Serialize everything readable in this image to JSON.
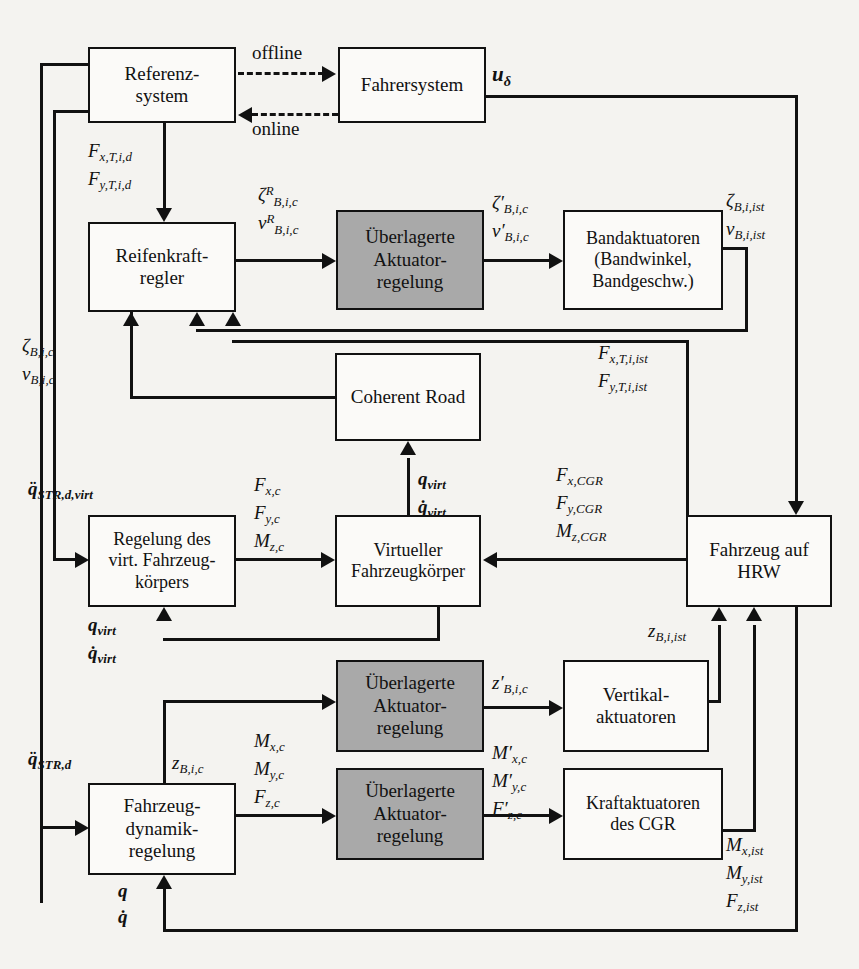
{
  "diagram": {
    "shaded_color": "#a9a9a9",
    "line_color": "#111111",
    "background": "#f4f3f0"
  },
  "blocks": {
    "referenzsystem": {
      "line1": "Referenz-",
      "line2": "system",
      "line3": ""
    },
    "fahrersystem": {
      "line1": "Fahrersystem",
      "line2": "",
      "line3": ""
    },
    "reifenkraftregler": {
      "line1": "Reifenkraft-",
      "line2": "regler",
      "line3": ""
    },
    "ueberlagerte_1": {
      "line1": "Überlagerte",
      "line2": "Aktuator-",
      "line3": "regelung"
    },
    "bandaktuatoren": {
      "line1": "Bandaktuatoren",
      "line2": "(Bandwinkel,",
      "line3": "Bandgeschw.)"
    },
    "coherent_road": {
      "line1": "Coherent Road",
      "line2": "",
      "line3": ""
    },
    "regelung_virt": {
      "line1": "Regelung des",
      "line2": "virt. Fahrzeug-",
      "line3": "körpers"
    },
    "virtueller_koerper": {
      "line1": "Virtueller",
      "line2": "Fahrzeugkörper",
      "line3": ""
    },
    "fahrzeug_hrw": {
      "line1": "Fahrzeug auf",
      "line2": "HRW",
      "line3": ""
    },
    "ueberlagerte_2": {
      "line1": "Überlagerte",
      "line2": "Aktuator-",
      "line3": "regelung"
    },
    "vertikalaktuatoren": {
      "line1": "Vertikal-",
      "line2": "aktuatoren",
      "line3": ""
    },
    "ueberlagerte_3": {
      "line1": "Überlagerte",
      "line2": "Aktuator-",
      "line3": "regelung"
    },
    "kraftaktuatoren": {
      "line1": "Kraftaktuatoren",
      "line2": "des CGR",
      "line3": ""
    },
    "fahrzeugdynamik": {
      "line1": "Fahrzeug-",
      "line2": "dynamik-",
      "line3": "regelung"
    }
  },
  "signals": {
    "offline": "offline",
    "online": "online",
    "u_delta": "uδ",
    "F_xTid": "Fx,T,i,d",
    "F_yTid": "Fy,T,i,d",
    "zeta_R_Bic": "ζRB,i,c",
    "v_R_Bic": "vRB,i,c",
    "zeta_p_Bic": "ζ′B,i,c",
    "v_p_Bic": "v′B,i,c",
    "zeta_Biist": "ζB,i,ist",
    "v_Biist": "vB,i,ist",
    "zeta_Bic": "ζB,i,c",
    "v_Bic": "vB,i,c",
    "F_xTiist": "Fx,T,i,ist",
    "F_yTiist": "Fy,T,i,ist",
    "qdd_STRdvirt": "q̈STR,d,virt",
    "F_xc": "Fx,c",
    "F_yc": "Fy,c",
    "M_zc": "Mz,c",
    "q_virt_top": "qvirt",
    "qd_virt_top": "q̇virt",
    "F_xCGR": "Fx,CGR",
    "F_yCGR": "Fy,CGR",
    "M_zCGR": "Mz,CGR",
    "q_virt_bot": "qvirt",
    "qd_virt_bot": "q̇virt",
    "z_p_Bic": "z′B,i,c",
    "z_Biist": "zB,i,ist",
    "M_p_xc": "M′x,c",
    "M_p_yc": "M′y,c",
    "F_p_zc": "F′z,c",
    "qdd_STRd": "q̈STR,d",
    "z_Bic": "zB,i,c",
    "M_xc": "Mx,c",
    "M_yc": "My,c",
    "F_zc": "Fz,c",
    "M_xist": "Mx,ist",
    "M_yist": "My,ist",
    "F_zist": "Fz,ist",
    "q": "q",
    "qd": "q̇"
  }
}
